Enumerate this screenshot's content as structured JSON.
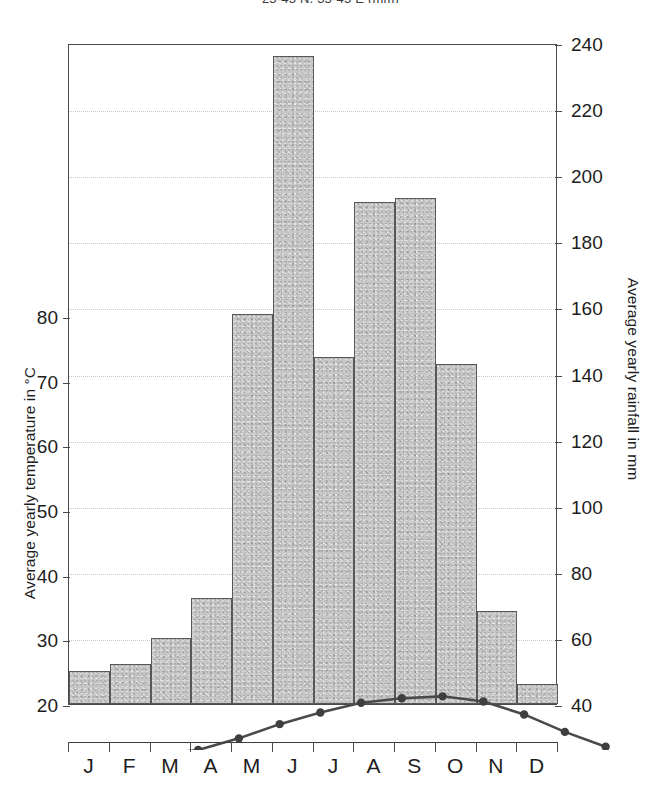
{
  "chart_title": "25-45 N, 35-45 E (mm)",
  "axes": {
    "left_title": "Average yearly temperature in °C",
    "right_title": "Average yearly rainfall in mm"
  },
  "chart_data": {
    "type": "bar",
    "title": "25-45 N, 35-45 E (mm)",
    "categories": [
      "J",
      "F",
      "M",
      "A",
      "M",
      "J",
      "J",
      "A",
      "S",
      "O",
      "N",
      "D"
    ],
    "xlabel": "",
    "grid": true,
    "legend": "none",
    "series": [
      {
        "name": "Average yearly rainfall in mm",
        "type": "bar",
        "axis": "right",
        "unit": "mm",
        "values": [
          50,
          52,
          60,
          72,
          158,
          236,
          145,
          192,
          193,
          143,
          68,
          46
        ]
      },
      {
        "name": "Average yearly temperature in °C",
        "type": "line",
        "axis": "left",
        "unit": "°C",
        "values": [
          19.3,
          20.0,
          21.8,
          24.0,
          25.8,
          27.3,
          28.0,
          28.3,
          27.5,
          25.5,
          22.8,
          20.5
        ]
      }
    ],
    "left_axis": {
      "label": "Average yearly temperature in °C",
      "ticks": [
        20,
        30,
        40,
        50,
        60,
        70,
        80
      ],
      "ylim": [
        16,
        80
      ]
    },
    "right_axis": {
      "label": "Average yearly rainfall in mm",
      "ticks": [
        40,
        60,
        80,
        100,
        120,
        140,
        160,
        180,
        200,
        220,
        240
      ],
      "ylim": [
        40,
        240
      ]
    },
    "colors": {
      "bar_fill": "#c6c6c6",
      "bar_border": "#585858",
      "line": "#4a4a4a",
      "grid": "#c9c9c9",
      "text": "#1d1d1d"
    }
  }
}
